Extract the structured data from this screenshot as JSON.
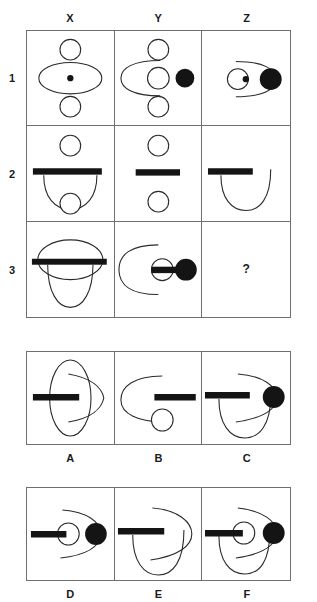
{
  "puzzle": {
    "type": "visual-analogy-matrix",
    "column_headers": [
      "X",
      "Y",
      "Z"
    ],
    "row_labels": [
      "1",
      "2",
      "3"
    ],
    "missing_cell": {
      "row": "3",
      "column": "Z",
      "marker": "?"
    },
    "matrix_cells": [
      {
        "id": "X1",
        "row": "1",
        "column": "X",
        "description": "Large horizontal ellipse with a small filled dot at its center; a small open circle above the ellipse and a small open circle below it.",
        "elements": [
          "ellipse-horizontal",
          "center-dot-filled",
          "circle-top-open",
          "circle-bottom-open"
        ]
      },
      {
        "id": "Y1",
        "row": "1",
        "column": "Y",
        "description": "Open C-shaped arc facing right; a small open circle at center, a large filled circle to the right, small open circles above and below.",
        "elements": [
          "arc-open-right",
          "circle-center-open",
          "circle-filled-right",
          "circle-top-open",
          "circle-bottom-open"
        ]
      },
      {
        "id": "Z1",
        "row": "1",
        "column": "Z",
        "description": "Arc opening to the left; small open circle containing a tiny filled dot; large filled circle on the right.",
        "elements": [
          "arc-open-left",
          "circle-center-open",
          "center-dot-filled",
          "circle-filled-right"
        ]
      },
      {
        "id": "X2",
        "row": "2",
        "column": "X",
        "description": "Wide thick horizontal bar with a U-shaped curve hanging beneath it; a small open circle above the bar and a small open circle at the bottom of the U.",
        "elements": [
          "bar-wide",
          "u-curve-below",
          "circle-top-open",
          "circle-bottom-open"
        ]
      },
      {
        "id": "Y2",
        "row": "2",
        "column": "Y",
        "description": "Short thick horizontal bar centered, with a small open circle above and a small open circle below.",
        "elements": [
          "bar-short",
          "circle-top-open",
          "circle-bottom-open"
        ]
      },
      {
        "id": "Z2",
        "row": "2",
        "column": "Z",
        "description": "Short thick horizontal bar at upper left with a U-shaped curve descending from it to the right.",
        "elements": [
          "bar-short",
          "u-curve-below"
        ]
      },
      {
        "id": "X3",
        "row": "3",
        "column": "X",
        "description": "Horizontal ellipse crossed by a wide thick horizontal bar, with a U-shaped curve hanging below.",
        "elements": [
          "ellipse-horizontal",
          "bar-wide",
          "u-curve-below"
        ]
      },
      {
        "id": "Y3",
        "row": "3",
        "column": "Y",
        "description": "C-shaped arc opening to the right; a small open circle pierced by a thick bar that extends right into a large filled circle.",
        "elements": [
          "arc-open-right",
          "circle-center-open",
          "bar-short",
          "circle-filled-right"
        ]
      },
      {
        "id": "Z3",
        "row": "3",
        "column": "Z",
        "description": "Empty cell containing a question mark — the answer to be selected.",
        "elements": [
          "question-mark"
        ]
      }
    ],
    "options": [
      {
        "id": "A",
        "label": "A",
        "description": "Vertical ellipse with a thick horizontal bar through its left half and a rightward pointing curve overlapping it.",
        "elements": [
          "ellipse-vertical",
          "bar-wide",
          "arc-open-left"
        ]
      },
      {
        "id": "B",
        "label": "B",
        "description": "C-shaped arc opening to the right, a thick horizontal bar at the right, and a small open circle below center.",
        "elements": [
          "arc-open-right",
          "bar-short",
          "circle-bottom-open"
        ]
      },
      {
        "id": "C",
        "label": "C",
        "description": "Thick horizontal bar at left, U-shaped curve below, arc opening to the left, and a large filled circle at the right.",
        "elements": [
          "bar-short",
          "u-curve-below",
          "arc-open-left",
          "circle-filled-right"
        ]
      },
      {
        "id": "D",
        "label": "D",
        "description": "Thick horizontal bar running from the left into a small open circle, arc opening left, and a large filled circle at the right.",
        "elements": [
          "bar-short",
          "circle-center-open",
          "arc-open-left",
          "circle-filled-right"
        ]
      },
      {
        "id": "E",
        "label": "E",
        "description": "Thick horizontal bar at left, U-shaped curve below, and an arc opening to the left — no filled circle.",
        "elements": [
          "bar-short",
          "u-curve-below",
          "arc-open-left"
        ]
      },
      {
        "id": "F",
        "label": "F",
        "description": "Thick horizontal bar running into a small open circle, U-shaped curve below, arc opening left, and a large filled circle at the right.",
        "elements": [
          "bar-short",
          "circle-center-open",
          "u-curve-below",
          "arc-open-left",
          "circle-filled-right"
        ]
      }
    ],
    "colors": {
      "ink": "#141414",
      "line": "#2a2a2a",
      "grid_border": "#6f6f6f",
      "background": "#ffffff"
    }
  }
}
